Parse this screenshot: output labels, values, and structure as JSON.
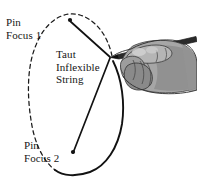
{
  "figure": {
    "background_color": "#ffffff",
    "ink_color": "#161616"
  },
  "labels": {
    "focus1": {
      "line1": "Pin",
      "line2": "Focus 1"
    },
    "focus2": {
      "line1": "Pin",
      "line2": "Focus 2"
    },
    "string": {
      "line1": "Taut",
      "line2": "Inflexible",
      "line3": "String"
    }
  },
  "markers": {
    "pin1": {
      "x": 69,
      "y": 20,
      "name": "pin-focus-1"
    },
    "pin2": {
      "x": 72,
      "y": 152,
      "name": "pin-focus-2"
    },
    "pencil_tip": {
      "x": 110,
      "y": 58
    }
  },
  "geometry": {
    "ellipse_drawn_portion": "solid",
    "ellipse_undrawn_portion": "dashed",
    "string_segments": 2
  }
}
